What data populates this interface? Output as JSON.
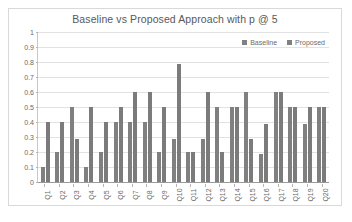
{
  "chart_data": {
    "type": "bar",
    "title": "Baseline vs Proposed Approach with p @ 5",
    "xlabel": "",
    "ylabel": "",
    "ylim": [
      0,
      1
    ],
    "ytick_labels": [
      "1",
      "0.9",
      "0.8",
      "0.7",
      "0.6",
      "0.5",
      "0.4",
      "0.3",
      "0.2",
      "0.1",
      "0"
    ],
    "ytick_values": [
      1,
      0.9,
      0.8,
      0.7,
      0.6,
      0.5,
      0.4,
      0.3,
      0.2,
      0.1,
      0
    ],
    "grid": true,
    "legend_position": "top-right",
    "categories": [
      "Q1",
      "Q2",
      "Q3",
      "Q4",
      "Q5",
      "Q6",
      "Q7",
      "Q8",
      "Q9",
      "Q10",
      "Q11",
      "Q12",
      "Q13",
      "Q14",
      "Q15",
      "Q16",
      "Q17",
      "Q18",
      "Q19",
      "Q20"
    ],
    "series": [
      {
        "name": "Baseline",
        "color": "#808080",
        "values": [
          0.1,
          0.2,
          0.5,
          0.1,
          0.2,
          0.4,
          0.4,
          0.4,
          0.2,
          0.29,
          0.2,
          0.29,
          0.5,
          0.5,
          0.6,
          0.19,
          0.6,
          0.5,
          0.39,
          0.5
        ]
      },
      {
        "name": "Proposed",
        "color": "#7b7b7b",
        "values": [
          0.4,
          0.4,
          0.29,
          0.5,
          0.4,
          0.5,
          0.6,
          0.6,
          0.5,
          0.79,
          0.2,
          0.6,
          0.2,
          0.5,
          0.29,
          0.39,
          0.6,
          0.5,
          0.5,
          0.5
        ]
      }
    ]
  }
}
